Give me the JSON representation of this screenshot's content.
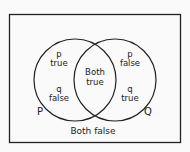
{
  "diagram": {
    "type": "venn",
    "sets": [
      {
        "name": "P",
        "label": "P"
      },
      {
        "name": "Q",
        "label": "Q"
      }
    ],
    "regions": {
      "p_only": {
        "line1": "p",
        "line2": "true",
        "line3": "q",
        "line4": "false"
      },
      "q_only": {
        "line1": "p",
        "line2": "false",
        "line3": "q",
        "line4": "true"
      },
      "both": {
        "line1": "Both",
        "line2": "true"
      },
      "neither": {
        "label": "Both false"
      }
    },
    "colors": {
      "stroke": "#222222",
      "background": "#fafafa"
    }
  }
}
